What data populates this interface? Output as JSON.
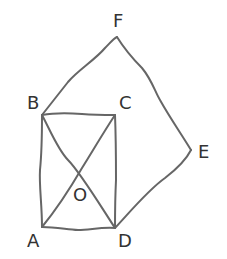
{
  "diagram": {
    "title": "",
    "stroke_color": "#666666",
    "label_color": "#333333",
    "points": {
      "F": {
        "label": "F",
        "x": 117,
        "y": 37,
        "lx": 120,
        "ly": 27
      },
      "B": {
        "label": "B",
        "x": 42,
        "y": 115,
        "lx": 34,
        "ly": 109
      },
      "C": {
        "label": "C",
        "x": 115,
        "y": 115,
        "lx": 125,
        "ly": 109
      },
      "E": {
        "label": "E",
        "x": 191,
        "y": 150,
        "lx": 204,
        "ly": 158
      },
      "A": {
        "label": "A",
        "x": 42,
        "y": 227,
        "lx": 34,
        "ly": 246
      },
      "D": {
        "label": "D",
        "x": 115,
        "y": 228,
        "lx": 125,
        "ly": 246
      },
      "O": {
        "label": "O",
        "x": 78,
        "y": 171,
        "lx": 79,
        "ly": 200
      }
    },
    "segments": [
      [
        "B",
        "F"
      ],
      [
        "F",
        "E"
      ],
      [
        "E",
        "D"
      ],
      [
        "B",
        "C"
      ],
      [
        "C",
        "D"
      ],
      [
        "D",
        "A"
      ],
      [
        "A",
        "B"
      ],
      [
        "B",
        "D"
      ],
      [
        "A",
        "C"
      ]
    ]
  }
}
